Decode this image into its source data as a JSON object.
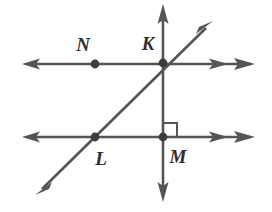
{
  "figure": {
    "background_color": "#ffffff",
    "line_color": "#555555",
    "point_color": "#3d3d3d",
    "label_color": "#2e2e2e",
    "width": 272,
    "height": 212
  },
  "labels": {
    "n": "N",
    "k": "K",
    "l": "L",
    "m": "M"
  },
  "points": [
    {
      "name": "N",
      "x": 95,
      "y": 64
    },
    {
      "name": "K",
      "x": 163,
      "y": 63
    },
    {
      "name": "L",
      "x": 95,
      "y": 137
    },
    {
      "name": "M",
      "x": 163,
      "y": 137
    }
  ],
  "label_positions": [
    {
      "name": "N",
      "x": 83,
      "y": 44
    },
    {
      "name": "K",
      "x": 148,
      "y": 43
    },
    {
      "name": "L",
      "x": 101,
      "y": 158
    },
    {
      "name": "M",
      "x": 178,
      "y": 156
    }
  ],
  "lines": [
    {
      "name": "top-horizontal-line",
      "x1": 22,
      "y1": 64,
      "x2": 254,
      "y2": 64,
      "arrow_start": true,
      "arrow_end": true,
      "double_arrow_end": true
    },
    {
      "name": "bottom-horizontal-line",
      "x1": 22,
      "y1": 137,
      "x2": 254,
      "y2": 137,
      "arrow_start": true,
      "arrow_end": true,
      "double_arrow_end": true
    },
    {
      "name": "vertical-line",
      "x1": 163,
      "y1": 5,
      "x2": 163,
      "y2": 201,
      "arrow_start": true,
      "arrow_end": true,
      "double_arrow_end": false
    },
    {
      "name": "diagonal-line",
      "x1": 36,
      "y1": 194,
      "x2": 212,
      "y2": 22,
      "arrow_start": true,
      "arrow_end": true,
      "double_arrow_end": false
    }
  ],
  "right_angle_marker": {
    "name": "right-angle-at-M",
    "x": 163,
    "y": 137,
    "size": 14,
    "direction": "up-right"
  }
}
